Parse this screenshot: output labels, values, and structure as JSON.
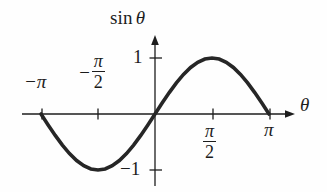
{
  "figure": {
    "kind": "math-plot",
    "caption": "",
    "background_color": "#fefefe",
    "ink_color": "#1d1d1d",
    "curve_color": "#262626"
  },
  "axes": {
    "y_title": {
      "function": "sin",
      "variable": "θ"
    },
    "x_title": "θ",
    "x_ticks": [
      {
        "id": "neg-pi",
        "label": "−π",
        "type": "plain",
        "value": -3.14159
      },
      {
        "id": "neg-pi-over-2",
        "sign": "−",
        "numerator": "π",
        "denominator": "2",
        "type": "fraction",
        "value": -1.5708
      },
      {
        "id": "pi-over-2",
        "sign": "",
        "numerator": "π",
        "denominator": "2",
        "type": "fraction",
        "value": 1.5708
      },
      {
        "id": "pi",
        "label": "π",
        "type": "plain",
        "value": 3.14159
      }
    ],
    "y_ticks": [
      {
        "id": "one",
        "label": "1",
        "value": 1
      },
      {
        "id": "neg-one",
        "label": "−1",
        "value": -1
      }
    ]
  },
  "chart_data": {
    "type": "line",
    "title": "",
    "subtitle": "",
    "xlabel": "θ",
    "ylabel": "sin θ",
    "grid": false,
    "legend": null,
    "xlim": [
      -3.14159,
      3.14159
    ],
    "ylim": [
      -1,
      1
    ],
    "xtick_values": [
      -3.14159,
      -1.5708,
      1.5708,
      3.14159
    ],
    "xtick_labels": [
      "−π",
      "−π/2",
      "π/2",
      "π"
    ],
    "ytick_values": [
      1,
      -1
    ],
    "ytick_labels": [
      "1",
      "−1"
    ],
    "series": [
      {
        "name": "sin θ",
        "x": [
          -3.14159,
          -2.94524,
          -2.74889,
          -2.55254,
          -2.35619,
          -2.15984,
          -1.9635,
          -1.76715,
          -1.5708,
          -1.37445,
          -1.1781,
          -0.98175,
          -0.7854,
          -0.58905,
          -0.3927,
          -0.19635,
          0.0,
          0.19635,
          0.3927,
          0.58905,
          0.7854,
          0.98175,
          1.1781,
          1.37445,
          1.5708,
          1.76715,
          1.9635,
          2.15984,
          2.35619,
          2.55254,
          2.74889,
          2.94524,
          3.14159
        ],
        "y": [
          0.0,
          -0.19509,
          -0.38268,
          -0.55557,
          -0.70711,
          -0.83147,
          -0.92388,
          -0.98079,
          -1.0,
          -0.98079,
          -0.92388,
          -0.83147,
          -0.70711,
          -0.55557,
          -0.38268,
          -0.19509,
          0.0,
          0.19509,
          0.38268,
          0.55557,
          0.70711,
          0.83147,
          0.92388,
          0.98079,
          1.0,
          0.98079,
          0.92388,
          0.83147,
          0.70711,
          0.55557,
          0.38268,
          0.19509,
          0.0
        ]
      }
    ],
    "annotations": []
  }
}
